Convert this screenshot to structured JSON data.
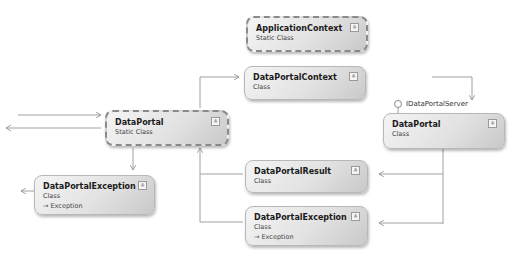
{
  "diagram": {
    "shapes": [
      {
        "id": "application-context",
        "name": "ApplicationContext",
        "kind": "Static Class",
        "base": null
      },
      {
        "id": "data-portal-context",
        "name": "DataPortalContext",
        "kind": "Class",
        "base": null
      },
      {
        "id": "data-portal-static",
        "name": "DataPortal",
        "kind": "Static Class",
        "base": null
      },
      {
        "id": "data-portal-class",
        "name": "DataPortal",
        "kind": "Class",
        "base": null
      },
      {
        "id": "data-portal-result",
        "name": "DataPortalResult",
        "kind": "Class",
        "base": null
      },
      {
        "id": "data-portal-exception-left",
        "name": "DataPortalException",
        "kind": "Class",
        "base": "→ Exception"
      },
      {
        "id": "data-portal-exception-right",
        "name": "DataPortalException",
        "kind": "Class",
        "base": "→ Exception"
      }
    ],
    "interface": {
      "name": "IDataPortalServer"
    },
    "expand_glyph": "≚",
    "colors": {
      "line": "#9a9a9a",
      "border": "#b8b8b8",
      "static_border": "#8a8a8a"
    }
  }
}
